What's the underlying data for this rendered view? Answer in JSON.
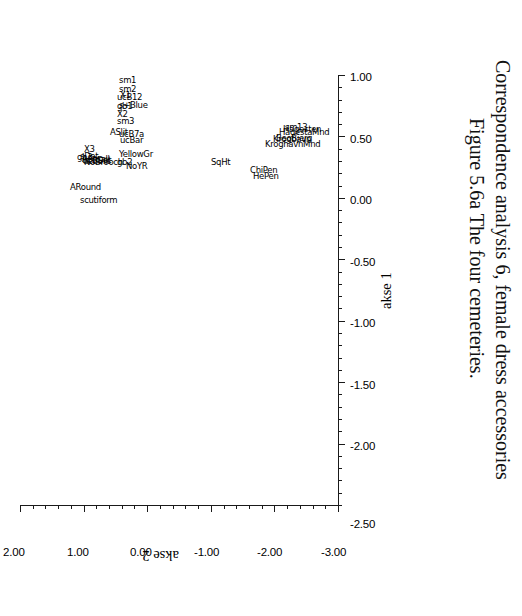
{
  "figure": {
    "caption_line1": "Figure 5.6a  The four cemeteries.",
    "caption_line2": "Correspondence analysis 6, female dress accessories"
  },
  "chart_data": {
    "type": "scatter",
    "title": "Figure 5.6a  The four cemeteries. Correspondence analysis 6, female dress accessories",
    "xlabel": "akse 1",
    "ylabel": "akse 2",
    "xlim": [
      -2.5,
      1.0
    ],
    "ylim": [
      -3.0,
      2.0
    ],
    "xticks": [
      "-2.00",
      "-1.50",
      "-1.00",
      "-0.50",
      "0.00",
      "0.50",
      "1.00"
    ],
    "xtick_values": [
      -2.0,
      -1.5,
      -1.0,
      -0.5,
      0.0,
      0.5,
      1.0
    ],
    "yticks": [
      "-3.00",
      "-2.00",
      "-1.00",
      "0.00",
      "1.00",
      "2.00"
    ],
    "ytick_values": [
      -3.0,
      -2.0,
      -1.0,
      0.0,
      1.0,
      2.0
    ],
    "extra_xtick": "-2.50",
    "grid": false,
    "legend": "none",
    "orientation": "plot rotated 90 degrees (axis labels read sideways)",
    "points": [
      {
        "label": "ARound",
        "x": 0.13,
        "y": 1.22
      },
      {
        "label": "scutiform",
        "x": 0.02,
        "y": 1.05
      },
      {
        "label": "gb3",
        "x": 0.37,
        "y": 1.1
      },
      {
        "label": "X3",
        "x": 0.44,
        "y": 1.0
      },
      {
        "label": "ASmall",
        "x": 0.36,
        "y": 1.03
      },
      {
        "label": "ucBDot",
        "x": 0.35,
        "y": 1.02
      },
      {
        "label": "sDot",
        "x": 0.38,
        "y": 1.06
      },
      {
        "label": "ucBSlit",
        "x": 0.34,
        "y": 1.01
      },
      {
        "label": "NoBrooch",
        "x": 0.33,
        "y": 1.0
      },
      {
        "label": "NoYR",
        "x": 0.3,
        "y": 0.33
      },
      {
        "label": "gb2",
        "x": 0.33,
        "y": 0.47
      },
      {
        "label": "YellowGr",
        "x": 0.4,
        "y": 0.45
      },
      {
        "label": "ucBar",
        "x": 0.51,
        "y": 0.42
      },
      {
        "label": "ucB7a",
        "x": 0.56,
        "y": 0.45
      },
      {
        "label": "ASlit",
        "x": 0.58,
        "y": 0.58
      },
      {
        "label": "sm3",
        "x": 0.67,
        "y": 0.48
      },
      {
        "label": "X2",
        "x": 0.72,
        "y": 0.48
      },
      {
        "label": "gb1",
        "x": 0.79,
        "y": 0.48
      },
      {
        "label": "s+Blue",
        "x": 0.8,
        "y": 0.44
      },
      {
        "label": "ucB12",
        "x": 0.86,
        "y": 0.48
      },
      {
        "label": "X1",
        "x": 0.88,
        "y": 0.43
      },
      {
        "label": "sm2",
        "x": 0.93,
        "y": 0.45
      },
      {
        "label": "sm1",
        "x": 1.0,
        "y": 0.44
      },
      {
        "label": "SqHt",
        "x": 0.33,
        "y": -1.0
      },
      {
        "label": "ChiPen",
        "x": 0.27,
        "y": -1.62
      },
      {
        "label": "HePen",
        "x": 0.22,
        "y": -1.67
      },
      {
        "label": "KroghavnMnd",
        "x": 0.48,
        "y": -1.85
      },
      {
        "label": "Krogbavn",
        "x": 0.52,
        "y": -1.98
      },
      {
        "label": "BeoBjerg",
        "x": 0.53,
        "y": -2.02
      },
      {
        "label": "HagestaMnd",
        "x": 0.58,
        "y": -2.08
      },
      {
        "label": "Hagesten",
        "x": 0.6,
        "y": -2.13
      },
      {
        "label": "sm13",
        "x": 0.62,
        "y": -2.16
      }
    ]
  }
}
